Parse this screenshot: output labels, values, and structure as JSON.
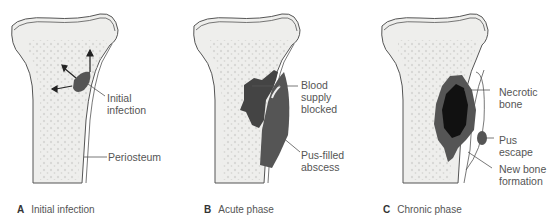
{
  "figure": {
    "panels": [
      {
        "letter": "A",
        "caption": "Initial infection",
        "labels": [
          "Initial",
          "infection",
          "Periosteum"
        ]
      },
      {
        "letter": "B",
        "caption": "Acute phase",
        "labels": [
          "Blood",
          "supply",
          "blocked",
          "Pus-filled",
          "abscess"
        ]
      },
      {
        "letter": "C",
        "caption": "Chronic phase",
        "labels": [
          "Necrotic",
          "bone",
          "Pus",
          "escape",
          "New bone",
          "formation"
        ]
      }
    ],
    "colors": {
      "bone_fill": "#eeeeec",
      "spongy_dots": "#d7d7d5",
      "outline": "#555555",
      "infection": "#555555",
      "necrotic": "#111111"
    }
  }
}
